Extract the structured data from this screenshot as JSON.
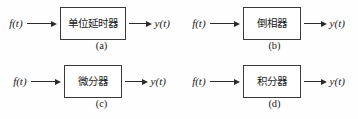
{
  "figure": {
    "background_color": "#fefefe",
    "line_color": "#2b2b2b",
    "box_border_color": "#3a3a3a",
    "input_signal": "f(t)",
    "output_signal": "y(t)",
    "arrow_in_icon": "arrow-right-icon",
    "arrow_out_icon": "arrow-right-icon",
    "blocks": [
      {
        "caption": "(a)",
        "label": "单位延时器",
        "input": "f(t)",
        "output": "y(t)",
        "width_class": "wide"
      },
      {
        "caption": "(b)",
        "label": "倒相器",
        "input": "f(t)",
        "output": "y(t)",
        "width_class": "narrow"
      },
      {
        "caption": "(c)",
        "label": "微分器",
        "input": "f(t)",
        "output": "y(t)",
        "width_class": "narrow"
      },
      {
        "caption": "(d)",
        "label": "积分器",
        "input": "f(t)",
        "output": "y(t)",
        "width_class": "narrow"
      }
    ]
  }
}
